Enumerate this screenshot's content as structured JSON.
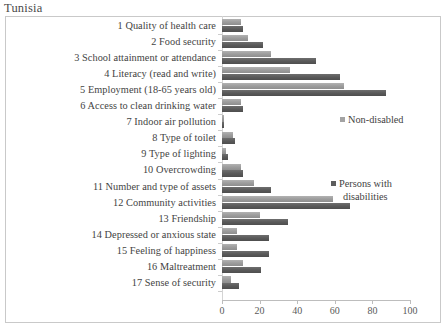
{
  "chart_title": "Tunisia",
  "legend": {
    "non_disabled_label": "Non-disabled",
    "pwd_label_line1": "Persons with",
    "pwd_label_line2": "disabilities",
    "non_disabled_color": "#a3a3a3",
    "pwd_color": "#5d5d5d"
  },
  "axis": {
    "ticks": [
      "0",
      "20",
      "40",
      "60",
      "80",
      "100"
    ]
  },
  "chart_data": {
    "type": "bar",
    "orientation": "horizontal",
    "title": "Tunisia",
    "xlabel": "",
    "ylabel": "",
    "xlim": [
      0,
      100
    ],
    "grid": false,
    "legend_position": "right",
    "categories": [
      "1 Quality of health care",
      "2 Food security",
      "3 School attainment or attendance",
      "4 Literacy (read and write)",
      "5 Employment  (18-65 years old)",
      "6 Access to clean drinking water",
      "7 Indoor air pollution",
      "8 Type of toilet",
      "9 Type of lighting",
      "10 Overcrowding",
      "11 Number and type of assets",
      "12 Community activities",
      "13 Friendship",
      "14 Depressed or anxious state",
      "15 Feeling of happiness",
      "16 Maltreatment",
      "17 Sense of security"
    ],
    "series": [
      {
        "name": "Non-disabled",
        "color": "#a3a3a3",
        "values": [
          10,
          14,
          26,
          36,
          65,
          10,
          1,
          6,
          2,
          10,
          17,
          59,
          20,
          8,
          8,
          11,
          5
        ]
      },
      {
        "name": "Persons with disabilities",
        "color": "#5d5d5d",
        "values": [
          11,
          22,
          50,
          63,
          87,
          11,
          1,
          7,
          3,
          11,
          26,
          68,
          35,
          25,
          25,
          21,
          9
        ]
      }
    ]
  }
}
